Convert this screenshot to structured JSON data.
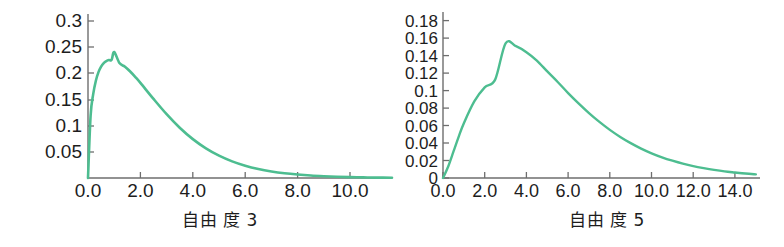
{
  "figure": {
    "background_color": "#ffffff",
    "curve_color": "#4dbd90",
    "axis_color": "#6e6e6e",
    "text_color": "#1d1d1d"
  },
  "panels": [
    {
      "id": "left",
      "caption": "自由 度 3",
      "y_ticks": [
        "0.05",
        "0.1",
        "0.15",
        "0.2",
        "0.25",
        "0.3"
      ],
      "x_ticks": [
        "0.0",
        "2.0",
        "4.0",
        "6.0",
        "8.0",
        "10.0"
      ]
    },
    {
      "id": "right",
      "caption": "自由 度 5",
      "y_ticks": [
        "0",
        "0.02",
        "0.04",
        "0.06",
        "0.08",
        "0.1",
        "0.12",
        "0.14",
        "0.16",
        "0.18"
      ],
      "x_ticks": [
        "0.0",
        "2.0",
        "4.0",
        "6.0",
        "8.0",
        "10.0",
        "12.0",
        "14.0"
      ]
    }
  ],
  "chart_data": [
    {
      "type": "line",
      "title": "自由 度 3",
      "xlabel": "",
      "ylabel": "",
      "distribution": "chi-squared probability density function",
      "degrees_of_freedom": 3,
      "xlim": [
        0,
        11.6
      ],
      "ylim": [
        0,
        0.315
      ],
      "grid": false,
      "legend": "none",
      "line_color": "#4dbd90",
      "xticks": [
        0.0,
        2.0,
        4.0,
        6.0,
        8.0,
        10.0
      ],
      "xtick_labels": [
        "0.0",
        "2.0",
        "4.0",
        "6.0",
        "8.0",
        "10.0"
      ],
      "yticks": [
        0.05,
        0.1,
        0.15,
        0.2,
        0.25,
        0.3
      ],
      "ytick_labels": [
        "0.05",
        "0.1",
        "0.15",
        "0.2",
        "0.25",
        "0.3"
      ],
      "peak": {
        "x": 1.0,
        "y": 0.242
      },
      "x": [
        0.0,
        0.1,
        0.2,
        0.3,
        0.4,
        0.5,
        0.6,
        0.7,
        0.8,
        0.9,
        1.0,
        1.2,
        1.4,
        1.6,
        1.8,
        2.0,
        2.5,
        3.0,
        3.5,
        4.0,
        4.5,
        5.0,
        5.5,
        6.0,
        6.5,
        7.0,
        7.5,
        8.0,
        8.5,
        9.0,
        9.5,
        10.0,
        10.5,
        11.0,
        11.6
      ],
      "y": [
        0.0,
        0.12,
        0.1615,
        0.1869,
        0.2033,
        0.2139,
        0.2207,
        0.2246,
        0.2265,
        0.2269,
        0.242,
        0.2207,
        0.2141,
        0.205,
        0.1943,
        0.1827,
        0.1519,
        0.1226,
        0.0966,
        0.0747,
        0.057,
        0.0429,
        0.032,
        0.0236,
        0.0173,
        0.0126,
        0.0091,
        0.0066,
        0.0047,
        0.0034,
        0.0024,
        0.0017,
        0.0012,
        0.0008,
        0.0005
      ]
    },
    {
      "type": "line",
      "title": "自由 度 5",
      "xlabel": "",
      "ylabel": "",
      "distribution": "chi-squared probability density function",
      "degrees_of_freedom": 5,
      "xlim": [
        0,
        15.2
      ],
      "ylim": [
        0,
        0.19
      ],
      "grid": false,
      "legend": "none",
      "line_color": "#4dbd90",
      "xticks": [
        0.0,
        2.0,
        4.0,
        6.0,
        8.0,
        10.0,
        12.0,
        14.0
      ],
      "xtick_labels": [
        "0.0",
        "2.0",
        "4.0",
        "6.0",
        "8.0",
        "10.0",
        "12.0",
        "14.0"
      ],
      "yticks": [
        0,
        0.02,
        0.04,
        0.06,
        0.08,
        0.1,
        0.12,
        0.14,
        0.16,
        0.18
      ],
      "ytick_labels": [
        "0",
        "0.02",
        "0.04",
        "0.06",
        "0.08",
        "0.1",
        "0.12",
        "0.14",
        "0.16",
        "0.18"
      ],
      "peak": {
        "x": 3.0,
        "y": 0.1542
      },
      "x": [
        0.0,
        0.25,
        0.5,
        0.75,
        1.0,
        1.5,
        2.0,
        2.5,
        3.0,
        3.5,
        4.0,
        4.5,
        5.0,
        5.5,
        6.0,
        6.5,
        7.0,
        7.5,
        8.0,
        8.5,
        9.0,
        9.5,
        10.0,
        10.5,
        11.0,
        11.5,
        12.0,
        12.5,
        13.0,
        13.5,
        14.0,
        14.5,
        15.0
      ],
      "y": [
        0.0,
        0.0132,
        0.0301,
        0.0471,
        0.0627,
        0.0876,
        0.1038,
        0.1126,
        0.1542,
        0.1509,
        0.144,
        0.1344,
        0.122,
        0.1099,
        0.0972,
        0.0854,
        0.0743,
        0.0642,
        0.0551,
        0.047,
        0.0399,
        0.0337,
        0.0283,
        0.0237,
        0.0198,
        0.0164,
        0.0136,
        0.0113,
        0.0093,
        0.0076,
        0.0063,
        0.0051,
        0.0042
      ]
    }
  ]
}
